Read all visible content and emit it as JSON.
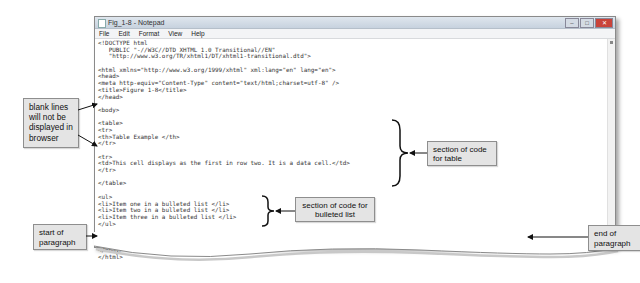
{
  "window": {
    "title": "Fig_1-8 - Notepad",
    "controls": {
      "minimize": "–",
      "maximize": "□",
      "close": "✕"
    }
  },
  "menubar": {
    "items": [
      "File",
      "Edit",
      "Format",
      "View",
      "Help"
    ]
  },
  "code_lines": [
    "<!DOCTYPE html",
    "   PUBLIC \"-//W3C//DTD XHTML 1.0 Transitional//EN\"",
    "   \"http://www.w3.org/TR/xhtml1/DT/xhtml1-transitional.dtd\">",
    "",
    "<html xmlns=\"http://www.w3.org/1999/xhtml\" xml:lang=\"en\" lang=\"en\">",
    "<head>",
    "<meta http-equiv=\"Content-Type\" content=\"text/html;charset=utf-8\" />",
    "<title>Figure 1-8</title>",
    "</head>",
    "",
    "<body>",
    "",
    "<table>",
    "<tr>",
    "<th>Table Example </th>",
    "</tr>",
    "",
    "<tr>",
    "<td>This cell displays as the first in row two. It is a data cell.</td>",
    "</tr>",
    "",
    "</table>",
    "",
    "<ul>",
    "<li>Item one in a bulleted list </li>",
    "<li>Item two in a bulleted list </li>",
    "<li>Item three in a bulleted list </li>",
    "</ul>",
    "",
    "<p>This text displays as a new paragraph. It has a blank line between it and the bulleted list above.</p>",
    "",
    "</body>",
    "</html>"
  ],
  "callouts": {
    "blank_lines": "blank lines will not be displayed in browser",
    "section_table": "section of code for table",
    "section_list": "section of code for bulleted list",
    "start_paragraph": "start of paragraph",
    "end_paragraph": "end of paragraph"
  },
  "colors": {
    "callout_bg": "#e4e4e4",
    "callout_border": "#8e8e8e",
    "arrow": "#111111"
  }
}
